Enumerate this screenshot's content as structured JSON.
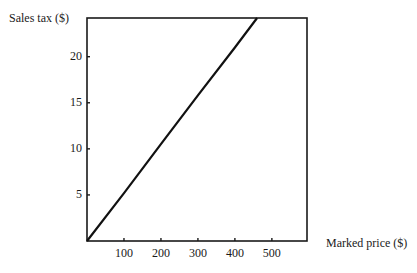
{
  "chart_data": {
    "type": "line",
    "title": "",
    "xlabel": "Marked price ($)",
    "ylabel": "Sales tax ($)",
    "xlim": [
      0,
      595
    ],
    "ylim": [
      0,
      24.2
    ],
    "x_ticks": [
      100,
      200,
      300,
      400,
      500
    ],
    "y_ticks": [
      5,
      10,
      15,
      20
    ],
    "grid": false,
    "legend": null,
    "series": [
      {
        "name": "Sales tax",
        "x": [
          0,
          100,
          200,
          300,
          400,
          460
        ],
        "y": [
          0,
          5.2,
          10.5,
          15.8,
          21.0,
          24.2
        ]
      }
    ]
  },
  "labels": {
    "ylabel": "Sales tax ($)",
    "xlabel": "Marked price ($)",
    "y_ticks": [
      "5",
      "10",
      "15",
      "20"
    ],
    "x_ticks": [
      "100",
      "200",
      "300",
      "400",
      "500"
    ]
  },
  "colors": {
    "axis": "#1a1a1a",
    "line": "#111111"
  }
}
